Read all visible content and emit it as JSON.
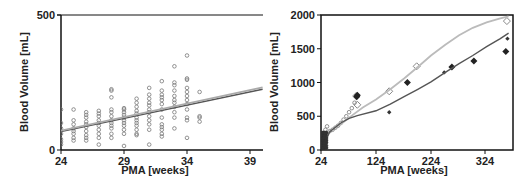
{
  "chart_data": [
    {
      "type": "scatter",
      "title": "",
      "xlabel": "PMA [weeks]",
      "ylabel": "Blood Volume [mL]",
      "xlim": [
        24,
        40
      ],
      "ylim": [
        0,
        500
      ],
      "xticks": [
        "24",
        "29",
        "34",
        "39"
      ],
      "yticks": [
        "0",
        "500"
      ],
      "grid": false,
      "series": [
        {
          "name": "observed",
          "marker": "open-circle",
          "points": [
            [
              24,
              150
            ],
            [
              24,
              100
            ],
            [
              24,
              80
            ],
            [
              24,
              60
            ],
            [
              24,
              40
            ],
            [
              24,
              30
            ],
            [
              24,
              20
            ],
            [
              25,
              150
            ],
            [
              25,
              110
            ],
            [
              25,
              95
            ],
            [
              25,
              80
            ],
            [
              25,
              70
            ],
            [
              25,
              60
            ],
            [
              25,
              45
            ],
            [
              25,
              35
            ],
            [
              26,
              140
            ],
            [
              26,
              130
            ],
            [
              26,
              120
            ],
            [
              26,
              105
            ],
            [
              26,
              95
            ],
            [
              26,
              85
            ],
            [
              26,
              70
            ],
            [
              26,
              55
            ],
            [
              26,
              45
            ],
            [
              26,
              35
            ],
            [
              27,
              145
            ],
            [
              27,
              135
            ],
            [
              27,
              125
            ],
            [
              27,
              110
            ],
            [
              27,
              100
            ],
            [
              27,
              90
            ],
            [
              27,
              75
            ],
            [
              27,
              60
            ],
            [
              27,
              45
            ],
            [
              27,
              20
            ],
            [
              28,
              225
            ],
            [
              28,
              220
            ],
            [
              28,
              195
            ],
            [
              28,
              150
            ],
            [
              28,
              140
            ],
            [
              28,
              125
            ],
            [
              28,
              110
            ],
            [
              28,
              100
            ],
            [
              28,
              90
            ],
            [
              28,
              80
            ],
            [
              28,
              60
            ],
            [
              28,
              45
            ],
            [
              29,
              155
            ],
            [
              29,
              150
            ],
            [
              29,
              140
            ],
            [
              29,
              130
            ],
            [
              29,
              120
            ],
            [
              29,
              110
            ],
            [
              29,
              100
            ],
            [
              29,
              90
            ],
            [
              29,
              75
            ],
            [
              29,
              60
            ],
            [
              29,
              15
            ],
            [
              30,
              190
            ],
            [
              30,
              175
            ],
            [
              30,
              160
            ],
            [
              30,
              145
            ],
            [
              30,
              135
            ],
            [
              30,
              120
            ],
            [
              30,
              110
            ],
            [
              30,
              100
            ],
            [
              30,
              90
            ],
            [
              30,
              75
            ],
            [
              30,
              60
            ],
            [
              30,
              55
            ],
            [
              31,
              230
            ],
            [
              31,
              205
            ],
            [
              31,
              190
            ],
            [
              31,
              175
            ],
            [
              31,
              165
            ],
            [
              31,
              150
            ],
            [
              31,
              140
            ],
            [
              31,
              125
            ],
            [
              31,
              110
            ],
            [
              31,
              95
            ],
            [
              31,
              75
            ],
            [
              31,
              20
            ],
            [
              32,
              255
            ],
            [
              32,
              220
            ],
            [
              32,
              205
            ],
            [
              32,
              195
            ],
            [
              32,
              185
            ],
            [
              32,
              170
            ],
            [
              32,
              150
            ],
            [
              32,
              120
            ],
            [
              32,
              95
            ],
            [
              32,
              85
            ],
            [
              32,
              75
            ],
            [
              32,
              60
            ],
            [
              32,
              50
            ],
            [
              33,
              310
            ],
            [
              33,
              250
            ],
            [
              33,
              240
            ],
            [
              33,
              220
            ],
            [
              33,
              200
            ],
            [
              33,
              185
            ],
            [
              33,
              175
            ],
            [
              33,
              160
            ],
            [
              33,
              140
            ],
            [
              33,
              120
            ],
            [
              33,
              80
            ],
            [
              34,
              350
            ],
            [
              34,
              265
            ],
            [
              34,
              260
            ],
            [
              34,
              230
            ],
            [
              34,
              215
            ],
            [
              34,
              200
            ],
            [
              34,
              185
            ],
            [
              34,
              170
            ],
            [
              34,
              150
            ],
            [
              34,
              120
            ],
            [
              34,
              110
            ],
            [
              34,
              45
            ],
            [
              35,
              215
            ],
            [
              35,
              125
            ],
            [
              35,
              120
            ],
            [
              35,
              105
            ]
          ]
        },
        {
          "name": "model-fit-dark",
          "line": true,
          "points": [
            [
              24,
              68
            ],
            [
              40,
              225
            ]
          ],
          "color": "#555555"
        },
        {
          "name": "model-fit-light",
          "line": true,
          "points": [
            [
              24,
              72
            ],
            [
              40,
              232
            ]
          ],
          "color": "#aaaaaa"
        }
      ]
    },
    {
      "type": "scatter",
      "title": "",
      "xlabel": "PMA [weeks]",
      "ylabel": "Blood Volume [mL]",
      "xlim": [
        24,
        375
      ],
      "ylim": [
        0,
        2000
      ],
      "xticks": [
        "24",
        "124",
        "224",
        "324"
      ],
      "yticks": [
        "0",
        "500",
        "1000",
        "1500",
        "2000"
      ],
      "grid": false,
      "series": [
        {
          "name": "open-diamond",
          "marker": "open-diamond",
          "points": [
            [
              90,
              670
            ],
            [
              88,
              800
            ],
            [
              148,
              870
            ],
            [
              198,
              1240
            ],
            [
              362,
              1910
            ]
          ]
        },
        {
          "name": "filled-diamond",
          "marker": "filled-diamond",
          "points": [
            [
              89,
              790
            ],
            [
              90,
              810
            ],
            [
              181,
              1000
            ],
            [
              262,
              1230
            ],
            [
              302,
              1320
            ],
            [
              360,
              1460
            ]
          ]
        },
        {
          "name": "filled-star",
          "marker": "filled-small",
          "points": [
            [
              148,
              560
            ],
            [
              248,
              1150
            ],
            [
              363,
              1650
            ]
          ]
        },
        {
          "name": "preterm-cluster",
          "marker": "open-circle",
          "points": [
            [
              25,
              40
            ],
            [
              26,
              100
            ],
            [
              27,
              150
            ],
            [
              28,
              200
            ],
            [
              29,
              180
            ],
            [
              30,
              120
            ],
            [
              31,
              250
            ],
            [
              32,
              300
            ],
            [
              33,
              250
            ],
            [
              35,
              350
            ],
            [
              40,
              280
            ],
            [
              45,
              300
            ],
            [
              50,
              330
            ],
            [
              55,
              360
            ],
            [
              60,
              400
            ],
            [
              65,
              450
            ],
            [
              70,
              500
            ],
            [
              75,
              560
            ],
            [
              80,
              620
            ],
            [
              85,
              700
            ]
          ]
        },
        {
          "name": "model-curve-light",
          "line": true,
          "color": "#bbbbbb",
          "points": [
            [
              24,
              0
            ],
            [
              40,
              280
            ],
            [
              60,
              380
            ],
            [
              80,
              510
            ],
            [
              100,
              630
            ],
            [
              124,
              750
            ],
            [
              150,
              900
            ],
            [
              175,
              1060
            ],
            [
              200,
              1230
            ],
            [
              224,
              1400
            ],
            [
              250,
              1560
            ],
            [
              275,
              1700
            ],
            [
              300,
              1810
            ],
            [
              325,
              1890
            ],
            [
              350,
              1950
            ],
            [
              365,
              1980
            ]
          ]
        },
        {
          "name": "model-curve-dark",
          "line": true,
          "color": "#555555",
          "points": [
            [
              24,
              0
            ],
            [
              40,
              270
            ],
            [
              60,
              400
            ],
            [
              75,
              470
            ],
            [
              90,
              510
            ],
            [
              124,
              580
            ],
            [
              150,
              680
            ],
            [
              175,
              790
            ],
            [
              200,
              900
            ],
            [
              224,
              1010
            ],
            [
              250,
              1150
            ],
            [
              275,
              1280
            ],
            [
              300,
              1400
            ],
            [
              325,
              1530
            ],
            [
              350,
              1650
            ],
            [
              365,
              1730
            ]
          ]
        }
      ]
    }
  ]
}
